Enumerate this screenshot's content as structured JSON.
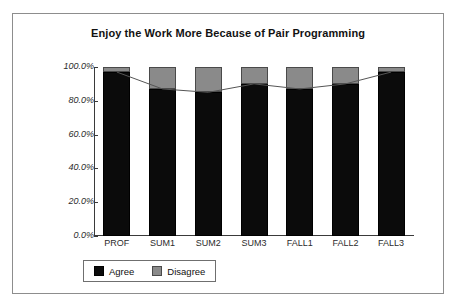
{
  "chart_data": {
    "type": "bar",
    "title": "Enjoy the Work More Because of Pair Programming",
    "xlabel": "",
    "ylabel": "",
    "categories": [
      "PROF",
      "SUM1",
      "SUM2",
      "SUM3",
      "FALL1",
      "FALL2",
      "FALL3"
    ],
    "series": [
      {
        "name": "Agree",
        "values": [
          97.0,
          87.0,
          85.0,
          90.0,
          87.0,
          90.0,
          97.0
        ],
        "color": "#0b0b0b"
      },
      {
        "name": "Disagree",
        "values": [
          3.0,
          13.0,
          15.0,
          10.0,
          13.0,
          10.0,
          3.0
        ],
        "color": "#8a8a8a"
      }
    ],
    "stacked": true,
    "ylim": [
      0,
      100
    ],
    "ytick_labels": [
      "100.0%",
      "80.0%",
      "60.0%",
      "40.0%",
      "20.0%",
      "0.0%"
    ],
    "ytick_values": [
      100,
      80,
      60,
      40,
      20,
      0
    ],
    "grid": false,
    "legend_position": "bottom",
    "overlay_line": {
      "name": "Agree trend",
      "values": [
        97.0,
        87.0,
        85.0,
        90.0,
        87.0,
        90.0,
        97.0
      ],
      "color": "#555555"
    }
  },
  "legend": {
    "entries": [
      {
        "label": "Agree",
        "swatch": "black-square-icon"
      },
      {
        "label": "Disagree",
        "swatch": "gray-square-icon"
      }
    ]
  }
}
